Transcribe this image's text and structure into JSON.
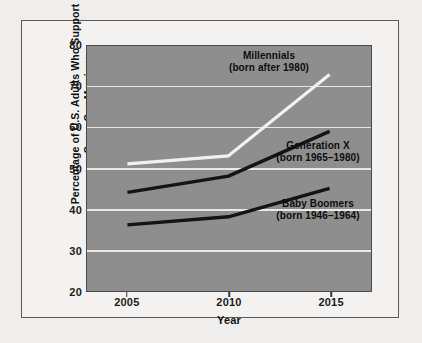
{
  "chart_data": {
    "type": "line",
    "title": "",
    "xlabel": "Year",
    "ylabel": "Percentage of U.S. Adults Who Support\nSame-Sex Marriage",
    "x": [
      2005,
      2010,
      2015
    ],
    "xticklabels": [
      "2005",
      "2010",
      "2015"
    ],
    "yticklabels": [
      "20",
      "30",
      "40",
      "50",
      "60",
      "70",
      "80"
    ],
    "yticks": [
      20,
      30,
      40,
      50,
      60,
      70,
      80
    ],
    "xlim": [
      2003,
      2017
    ],
    "ylim": [
      20,
      80
    ],
    "grid": true,
    "legend_position": "inline-annotations",
    "series": [
      {
        "name": "Millennials",
        "annotation": "Millennials\n(born after 1980)",
        "color": "#f2f1ed",
        "values": [
          51,
          53,
          73
        ]
      },
      {
        "name": "Generation X",
        "annotation": "Generation X\n(born 1965–1980)",
        "color": "#141414",
        "values": [
          44,
          48,
          59
        ]
      },
      {
        "name": "Baby Boomers",
        "annotation": "Baby Boomers\n(born 1946–1964)",
        "color": "#141414",
        "values": [
          36,
          38,
          45
        ]
      }
    ],
    "panel_background": "#8e8e8e",
    "gridline_color": "#e9e8e4",
    "figure_background": "#f3f2f0"
  }
}
